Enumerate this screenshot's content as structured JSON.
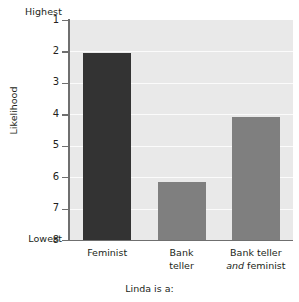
{
  "chart_data": {
    "type": "bar",
    "title": "",
    "xlabel": "Linda is a:",
    "ylabel": "Likelihood",
    "categories": [
      "Feminist",
      "Bank teller",
      "Bank teller and feminist"
    ],
    "values": [
      2.05,
      6.15,
      4.1
    ],
    "ylim": [
      1,
      8
    ],
    "y_inverted": true,
    "yticks": [
      "1",
      "2",
      "3",
      "4",
      "5",
      "6",
      "7",
      "8"
    ],
    "y_axis_top_label": "Highest",
    "y_axis_bottom_label": "Lowest",
    "grid": "horizontal-white",
    "legend": "none",
    "series": [
      {
        "name": "Likelihood rating",
        "values": [
          2.05,
          6.15,
          4.1
        ],
        "colors": [
          "#333333",
          "#7f7f7f",
          "#7f7f7f"
        ]
      }
    ]
  },
  "axis": {
    "extremes": {
      "highest": "Highest",
      "lowest": "Lowest"
    },
    "y_title": "Likelihood",
    "x_title": "Linda is a:",
    "ticks": [
      {
        "value": "1"
      },
      {
        "value": "2"
      },
      {
        "value": "3"
      },
      {
        "value": "4"
      },
      {
        "value": "5"
      },
      {
        "value": "6"
      },
      {
        "value": "7"
      },
      {
        "value": "8"
      }
    ]
  },
  "categories": [
    {
      "line1": "Feminist",
      "line2": "",
      "line2_italic_prefix": ""
    },
    {
      "line1": "Bank",
      "line2": "teller",
      "line2_italic_prefix": ""
    },
    {
      "line1": "Bank teller",
      "line2": "feminist",
      "line2_italic_prefix": "and"
    }
  ],
  "colors": {
    "bar_dark": "#333333",
    "bar_gray": "#7f7f7f",
    "plot_background": "#e9e9e9",
    "gridline": "#fbfbfb",
    "axis": "#6f6f6f",
    "text": "#231f20",
    "page_background": "#ffffff"
  }
}
